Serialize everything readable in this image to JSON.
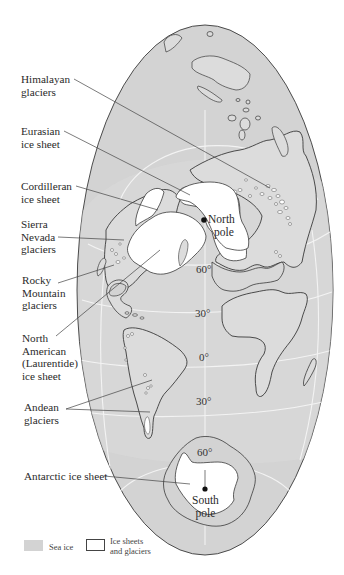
{
  "labels": {
    "himalayan": [
      "Himalayan",
      "glaciers"
    ],
    "eurasian": [
      "Eurasian",
      "ice sheet"
    ],
    "cordilleran": [
      "Cordilleran",
      "ice sheet"
    ],
    "sierra": [
      "Sierra",
      "Nevada",
      "glaciers"
    ],
    "rocky": [
      "Rocky",
      "Mountain",
      "glaciers"
    ],
    "laurentide": [
      "North",
      "American",
      "(Laurentide)",
      "ice sheet"
    ],
    "andean": [
      "Andean",
      "glaciers"
    ],
    "antarctic": "Antarctic ice sheet"
  },
  "poles": {
    "north": [
      "North",
      "pole"
    ],
    "south": [
      "South",
      "pole"
    ]
  },
  "latitudes": {
    "n60": "60°",
    "n30": "30°",
    "eq": "0°",
    "s30": "30°",
    "s60": "60°"
  },
  "legend": {
    "sea_ice": "Sea ice",
    "ice_sheets": [
      "Ice sheets",
      "and glaciers"
    ]
  },
  "colors": {
    "sea_ice": "#d3d3d3",
    "land": "#dedede",
    "ice_sheet": "#ffffff",
    "outline": "#3a3a3a",
    "graticule": "#f2f2f2"
  }
}
